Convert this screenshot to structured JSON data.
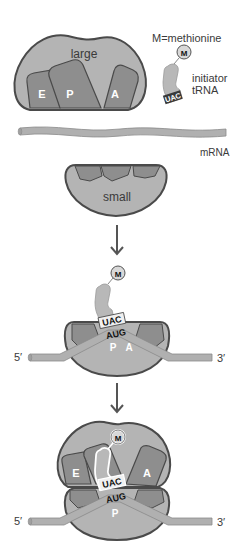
{
  "diagram": {
    "legend": {
      "methionine_key": "M=methionine",
      "methionine_symbol": "M",
      "initiator_label_line1": "initiator",
      "initiator_label_line2": "tRNA"
    },
    "stage1": {
      "large_subunit_label": "large",
      "sites": {
        "e": "E",
        "p": "P",
        "a": "A"
      },
      "trna_anticodon": "UAC",
      "mrna_label": "mRNA",
      "small_subunit_label": "small"
    },
    "stage2": {
      "methionine_symbol": "M",
      "anticodon": "UAC",
      "codon": "AUG",
      "site_p": "P",
      "site_a": "A",
      "five_prime": "5′",
      "three_prime": "3′"
    },
    "stage3": {
      "methionine_symbol": "M",
      "site_e": "E",
      "site_a": "A",
      "site_p": "P",
      "anticodon": "UAC",
      "codon": "AUG",
      "five_prime": "5′",
      "three_prime": "3′"
    },
    "colors": {
      "subunit_fill": "#b4b4b4",
      "subunit_outline": "#4a4a4a",
      "site_fill": "#8e8e8e",
      "mrna_fill": "#b0b0b0",
      "trna_fill": "#b8b8b8",
      "arrow": "#555555"
    }
  }
}
